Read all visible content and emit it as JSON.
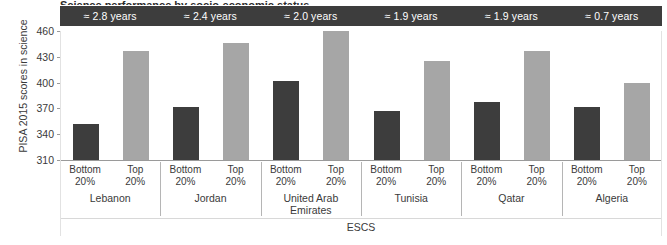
{
  "chart_data": {
    "type": "bar",
    "title": "Science performance by socio-economic status",
    "xlabel": "ESCS",
    "ylabel": "PISA 2015 scores in science",
    "ylim": [
      310,
      460
    ],
    "yticks": [
      460,
      430,
      400,
      370,
      340,
      310
    ],
    "grid": false,
    "legend_position": "none",
    "categories": [
      "Lebanon",
      "Jordan",
      "United Arab Emirates",
      "Tunisia",
      "Qatar",
      "Algeria"
    ],
    "subcategories": [
      "Bottom 20%",
      "Top 20%"
    ],
    "series": [
      {
        "name": "Bottom 20%",
        "color": "#3d3d3d",
        "values": [
          352,
          372,
          402,
          367,
          378,
          372
        ]
      },
      {
        "name": "Top 20%",
        "color": "#a6a6a6",
        "values": [
          437,
          446,
          460,
          425,
          437,
          399
        ]
      }
    ],
    "annotations": {
      "band_label": "Gap expressed in years of schooling",
      "values": [
        "≈ 2.8 years",
        "≈ 2.4 years",
        "≈ 2.0 years",
        "≈ 1.9 years",
        "≈ 1.9 years",
        "≈ 0.7 years"
      ]
    }
  },
  "header": {
    "cells": [
      {
        "label": "≈ 2.8 years"
      },
      {
        "label": "≈ 2.4 years"
      },
      {
        "label": "≈ 2.0 years"
      },
      {
        "label": "≈ 1.9 years"
      },
      {
        "label": "≈ 1.9 years"
      },
      {
        "label": "≈ 0.7 years"
      }
    ]
  },
  "axes": {
    "y_title": "PISA 2015 scores in science",
    "x_title": "ESCS",
    "y_ticks": [
      {
        "label": "460"
      },
      {
        "label": "430"
      },
      {
        "label": "400"
      },
      {
        "label": "370"
      },
      {
        "label": "340"
      },
      {
        "label": "310"
      }
    ]
  },
  "groups": [
    {
      "name": "Lebanon",
      "tick_a_line1": "Bottom",
      "tick_a_line2": "20%",
      "tick_b_line1": "Top",
      "tick_b_line2": "20%"
    },
    {
      "name": "Jordan",
      "tick_a_line1": "Bottom",
      "tick_a_line2": "20%",
      "tick_b_line1": "Top",
      "tick_b_line2": "20%"
    },
    {
      "name": "United Arab Emirates",
      "tick_a_line1": "Bottom",
      "tick_a_line2": "20%",
      "tick_b_line1": "Top",
      "tick_b_line2": "20%"
    },
    {
      "name": "Tunisia",
      "tick_a_line1": "Bottom",
      "tick_a_line2": "20%",
      "tick_b_line1": "Top",
      "tick_b_line2": "20%"
    },
    {
      "name": "Qatar",
      "tick_a_line1": "Bottom",
      "tick_a_line2": "20%",
      "tick_b_line1": "Top",
      "tick_b_line2": "20%"
    },
    {
      "name": "Algeria",
      "tick_a_line1": "Bottom",
      "tick_a_line2": "20%",
      "tick_b_line1": "Top",
      "tick_b_line2": "20%"
    }
  ],
  "title_clipped": "Science performance by socio-economic status",
  "colors": {
    "bar_bottom": "#3d3d3d",
    "bar_top": "#a6a6a6",
    "band": "#3d3d3d",
    "band_text": "#ffffff",
    "axis": "#9a9a9a",
    "text": "#3a3a3a"
  }
}
